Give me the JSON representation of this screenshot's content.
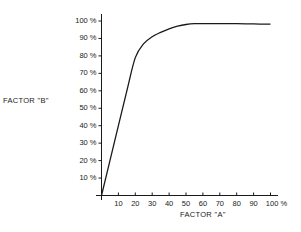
{
  "chart_data": {
    "type": "line",
    "title": "",
    "xlabel": "FACTOR \"A\"",
    "ylabel": "FACTOR \"B\"",
    "x_tick_labels": [
      "10",
      "20",
      "30",
      "40",
      "50",
      "60",
      "70",
      "80",
      "90",
      "100 %"
    ],
    "y_tick_labels": [
      "10 %",
      "20 %",
      "30 %",
      "40 %",
      "50 %",
      "60 %",
      "70 %",
      "80 %",
      "90 %",
      "100 %"
    ],
    "xlim": [
      0,
      100
    ],
    "ylim": [
      0,
      100
    ],
    "grid": false,
    "legend": null,
    "series": [
      {
        "name": "Factor B vs Factor A",
        "x": [
          0,
          5,
          10,
          15,
          20,
          25,
          30,
          35,
          40,
          45,
          50,
          55,
          60,
          70,
          80,
          90,
          100
        ],
        "y": [
          0,
          20,
          40,
          60,
          79,
          87,
          91,
          93.5,
          95.5,
          97,
          98,
          98.5,
          98.5,
          98.5,
          98.5,
          98.3,
          98.2
        ]
      }
    ],
    "line_color": "#1a1a1a"
  }
}
